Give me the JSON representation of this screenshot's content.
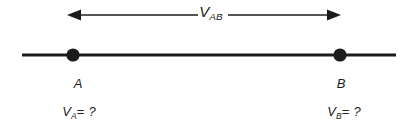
{
  "figure": {
    "background_color": "#ffffff",
    "stroke_color": "#1c1c1c",
    "width": 419,
    "height": 129
  },
  "measurement_arrow": {
    "label_symbol": "V",
    "label_subscript": "AB",
    "left_arrowhead_x": 68,
    "right_arrowhead_x": 340,
    "line_y": 15,
    "direction": "double"
  },
  "conductor": {
    "line_y": 55,
    "line_start_x": 22,
    "line_end_x": 396
  },
  "nodes": [
    {
      "name": "A",
      "label": "A",
      "x": 73,
      "y": 55,
      "radius": 6.5,
      "value_symbol": "V",
      "value_subscript": "A",
      "value_operator": "=",
      "value_text": "?"
    },
    {
      "name": "B",
      "label": "B",
      "x": 340,
      "y": 55,
      "radius": 6.5,
      "value_symbol": "V",
      "value_subscript": "B",
      "value_operator": "=",
      "value_text": "?"
    }
  ]
}
